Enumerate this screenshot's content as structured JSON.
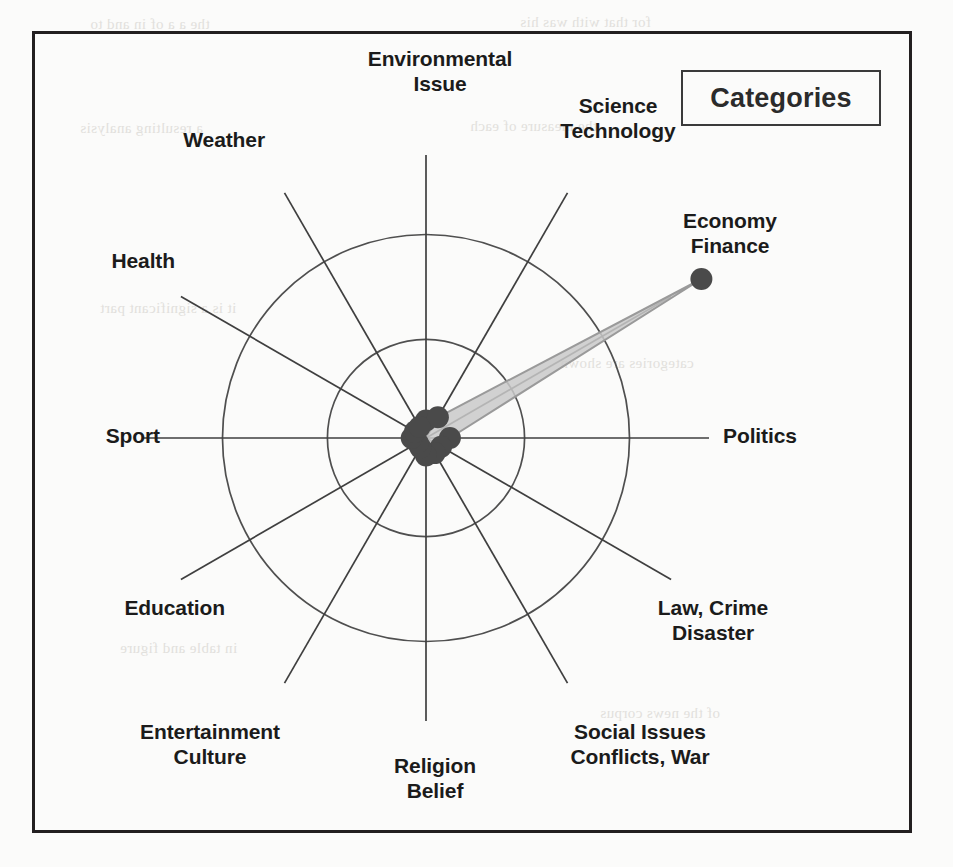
{
  "figure": {
    "kind": "radar-chart",
    "legend": {
      "title": "Categories"
    },
    "frame": {
      "border_color": "#231f20"
    }
  },
  "labels": {
    "environmental_issue": "Environmental\nIssue",
    "science_technology": "Science\nTechnology",
    "economy_finance": "Economy\nFinance",
    "politics": "Politics",
    "law_crime_disaster": "Law, Crime\nDisaster",
    "social_issues": "Social Issues\nConflicts, War",
    "religion_belief": "Religion\nBelief",
    "entertainment_culture": "Entertainment\nCulture",
    "education": "Education",
    "sport": "Sport",
    "health": "Health",
    "weather": "Weather"
  },
  "chart_data": {
    "type": "radar",
    "title": "Categories",
    "xlabel": "",
    "ylabel": "",
    "grid": true,
    "legend_position": "top-right",
    "rmin": 0,
    "rmax": 1.0,
    "grid_rings": [
      0.31,
      0.64
    ],
    "categories": [
      "Environmental Issue",
      "Science Technology",
      "Economy Finance",
      "Politics",
      "Law, Crime Disaster",
      "Social Issues Conflicts, War",
      "Religion Belief",
      "Entertainment Culture",
      "Education",
      "Sport",
      "Health",
      "Weather"
    ],
    "series": [
      {
        "name": "Categories",
        "values": [
          0.055,
          0.075,
          1.0,
          0.075,
          0.055,
          0.055,
          0.055,
          0.035,
          0.03,
          0.045,
          0.04,
          0.04
        ]
      }
    ],
    "marker_color": "#4a4a4a",
    "fill_color": "#c9c9c9",
    "line_color": "#9a9a9a"
  },
  "ghost_text": [
    "the a a of in and to",
    "for that with was his",
    "a resulting analysis",
    "the measure of each",
    "it is a significant part",
    "categories are shown",
    "in table and figure",
    "of the news corpus"
  ]
}
